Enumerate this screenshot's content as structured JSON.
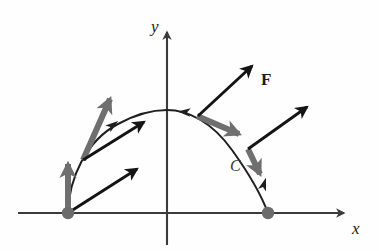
{
  "figure": {
    "background_color": "#fefefe",
    "axis_color": "#3b3b3b",
    "curve_color": "#1f1f1f",
    "field_vector_color": "#141414",
    "tangent_vector_color": "#6f6f6f",
    "endpoint_dot_color": "#6b6b6b",
    "labels": {
      "x_axis": "x",
      "y_axis": "y",
      "curve": "C",
      "vector_field": "F"
    },
    "axes": {
      "x_axis_y": 213,
      "y_axis_x": 167,
      "x_axis_start_x": 18,
      "x_axis_end_x": 350,
      "y_axis_top_y": 26,
      "y_axis_bottom_y": 245,
      "x_label_pos": [
        354,
        222
      ],
      "y_label_pos": [
        152,
        20
      ]
    },
    "curve": {
      "name": "C",
      "orientation": "counterclockwise-from-left-endpoint-over-apex-to-right-endpoint",
      "start_point": [
        68,
        213
      ],
      "apex_point": [
        167,
        110
      ],
      "end_point": [
        268,
        213
      ],
      "label_pos": [
        231,
        161
      ]
    },
    "endpoints": [
      {
        "name": "start-endpoint",
        "cx": 68,
        "cy": 213,
        "r": 6
      },
      {
        "name": "end-endpoint",
        "cx": 268,
        "cy": 213,
        "r": 6
      }
    ],
    "field_vectors": [
      {
        "name": "F-at-start-lower",
        "x1": 68,
        "y1": 213,
        "x2": 141,
        "y2": 166,
        "color": "#141414",
        "width": 3.0
      },
      {
        "name": "F-at-left-midpoint",
        "x1": 83,
        "y1": 160,
        "x2": 148,
        "y2": 119,
        "color": "#141414",
        "width": 3.0
      },
      {
        "name": "F-at-apex-right",
        "x1": 198,
        "y1": 116,
        "x2": 256,
        "y2": 62,
        "color": "#141414",
        "width": 3.0,
        "label": "F",
        "label_pos": [
          262,
          74
        ]
      },
      {
        "name": "F-at-right-descent",
        "x1": 248,
        "y1": 149,
        "x2": 311,
        "y2": 104,
        "color": "#141414",
        "width": 3.0
      }
    ],
    "tangent_vectors": [
      {
        "name": "tangent-at-start",
        "x1": 68,
        "y1": 213,
        "x2": 68,
        "y2": 159,
        "color": "#6f6f6f",
        "width": 5.5
      },
      {
        "name": "tangent-at-left-midpoint",
        "x1": 83,
        "y1": 160,
        "x2": 112,
        "y2": 93,
        "color": "#6f6f6f",
        "width": 5.5
      },
      {
        "name": "tangent-at-apex-descent",
        "x1": 198,
        "y1": 116,
        "x2": 243,
        "y2": 136,
        "color": "#6f6f6f",
        "width": 5.5
      },
      {
        "name": "tangent-at-right-descent",
        "x1": 248,
        "y1": 149,
        "x2": 262,
        "y2": 178,
        "color": "#6f6f6f",
        "width": 5.5
      }
    ],
    "curve_direction_markers": [
      {
        "name": "direction-marker-left-ascent",
        "x": 113,
        "y": 125,
        "angle": -35
      },
      {
        "name": "direction-marker-apex",
        "x": 185,
        "y": 112,
        "angle": 185
      },
      {
        "name": "direction-marker-right-end",
        "x": 265,
        "y": 182,
        "angle": -75
      }
    ]
  }
}
